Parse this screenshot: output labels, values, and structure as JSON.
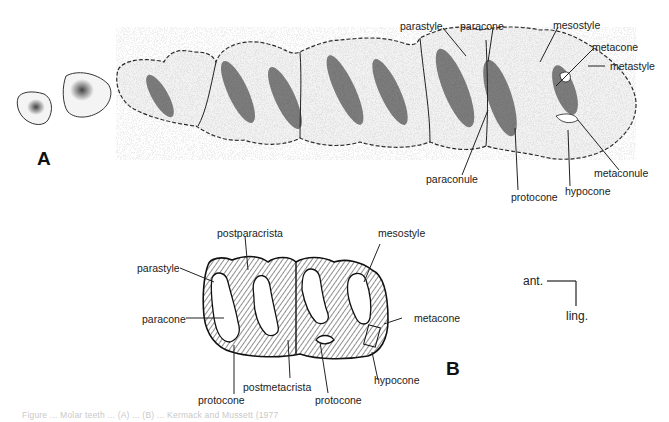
{
  "figure": {
    "panel_a": {
      "letter": "A",
      "labels": {
        "parastyle": "parastyle",
        "paracone": "paracone",
        "mesostyle": "mesostyle",
        "metacone": "metacone",
        "metastyle": "metastyle",
        "paraconule": "paraconule",
        "metaconule": "metaconule",
        "protocone": "protocone",
        "hypocone": "hypocone"
      }
    },
    "panel_b": {
      "letter": "B",
      "labels": {
        "postparacrista": "postparacrista",
        "mesostyle": "mesostyle",
        "parastyle": "parastyle",
        "paracone": "paracone",
        "metacone": "metacone",
        "protocone_1": "protocone",
        "protocone_2": "protocone",
        "postmetacrista": "postmetacrista",
        "hypocone": "hypocone"
      }
    },
    "orientation": {
      "anterior": "ant.",
      "lingual": "ling."
    },
    "caption": "Figure ... Molar teeth ... (A) ... (B) ... Kermack and Mussett (1977"
  }
}
